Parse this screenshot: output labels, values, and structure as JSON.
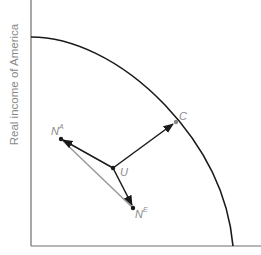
{
  "diagram": {
    "y_axis_label": "Real income of America",
    "points": {
      "NA": {
        "base": "N",
        "sup": "A"
      },
      "U": {
        "label": "U"
      },
      "NE": {
        "base": "N",
        "sup": "E"
      },
      "C": {
        "label": "C"
      }
    },
    "colors": {
      "axis": "#6e6e6e",
      "frontier": "#1a1a1a",
      "arrow": "#1a1a1a",
      "gray_line": "#999999",
      "label": "#8a8a8a"
    }
  }
}
